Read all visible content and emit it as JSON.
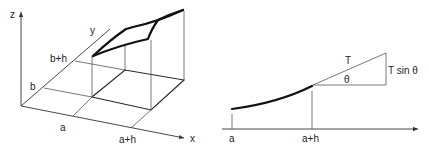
{
  "left_diagram": {
    "title": "surface element over rectangle",
    "axis_labels": {
      "z": "z",
      "y": "y",
      "x": "x"
    },
    "y_ticks": [
      "b+h",
      "b"
    ],
    "x_ticks": [
      "a",
      "a+h"
    ]
  },
  "right_diagram": {
    "title": "tension on string segment",
    "x_ticks": [
      "a",
      "a+h"
    ],
    "tension_label": "T",
    "angle_label": "θ",
    "vertical_component_label": "T sin θ"
  },
  "colors": {
    "line": "#222222",
    "background": "#ffffff"
  }
}
